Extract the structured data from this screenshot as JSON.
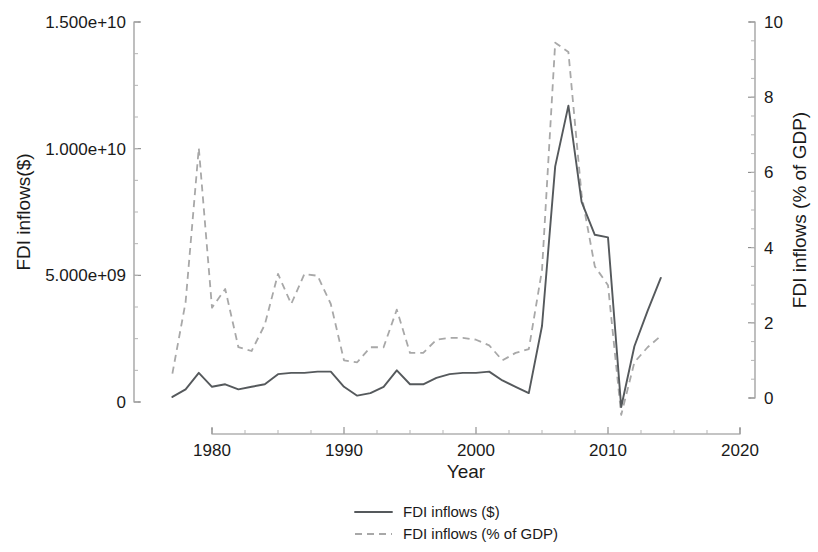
{
  "chart_data": {
    "type": "line",
    "title": "",
    "xlabel": "Year",
    "ylabel": "FDI inflows($)",
    "y2label": "FDI inflows (% of GDP)",
    "xlim": [
      1976,
      2020
    ],
    "xticks": [
      1980,
      1990,
      2000,
      2010,
      2020
    ],
    "xtick_labels": [
      "1980",
      "1990",
      "2000",
      "2010",
      "2020"
    ],
    "ylim": [
      -1000000000,
      15000000000
    ],
    "yticks": [
      0,
      5000000000,
      10000000000,
      15000000000
    ],
    "ytick_labels": [
      "0",
      "5.000e+09",
      "1.000e+10",
      "1.500e+10"
    ],
    "y2lim": [
      -0.7,
      10
    ],
    "y2ticks": [
      0,
      2,
      4,
      6,
      8,
      10
    ],
    "y2tick_labels": [
      "0",
      "2",
      "4",
      "6",
      "8",
      "10"
    ],
    "grid": false,
    "legend_position": "bottom",
    "x": [
      1977,
      1978,
      1979,
      1980,
      1981,
      1982,
      1983,
      1984,
      1985,
      1986,
      1987,
      1988,
      1989,
      1990,
      1991,
      1992,
      1993,
      1994,
      1995,
      1996,
      1997,
      1998,
      1999,
      2000,
      2001,
      2002,
      2003,
      2004,
      2005,
      2006,
      2007,
      2008,
      2009,
      2010,
      2011,
      2012,
      2013,
      2014
    ],
    "series": [
      {
        "name": "FDI inflows ($)",
        "axis": "left",
        "style": "solid",
        "color": "#55595c",
        "values": [
          200000000,
          500000000,
          1150000000,
          600000000,
          700000000,
          500000000,
          600000000,
          700000000,
          1100000000,
          1150000000,
          1150000000,
          1200000000,
          1200000000,
          600000000,
          250000000,
          350000000,
          600000000,
          1250000000,
          700000000,
          700000000,
          950000000,
          1100000000,
          1150000000,
          1150000000,
          1200000000,
          850000000,
          600000000,
          350000000,
          3000000000,
          9300000000,
          11700000000,
          7900000000,
          6600000000,
          6500000000,
          -200000000,
          2200000000,
          3600000000,
          4900000000
        ]
      },
      {
        "name": "FDI inflows (% of GDP)",
        "axis": "right",
        "style": "dashed",
        "color": "#a8a8a8",
        "values": [
          0.65,
          2.55,
          6.65,
          2.4,
          2.9,
          1.35,
          1.25,
          1.95,
          3.3,
          2.5,
          3.3,
          3.25,
          2.5,
          1.0,
          0.95,
          1.35,
          1.35,
          2.35,
          1.2,
          1.2,
          1.55,
          1.6,
          1.6,
          1.55,
          1.4,
          1.0,
          1.2,
          1.3,
          3.4,
          9.45,
          9.2,
          5.4,
          3.5,
          3.0,
          -0.45,
          0.95,
          1.35,
          1.65
        ]
      }
    ],
    "legend": [
      {
        "label": "FDI inflows ($)",
        "style": "solid",
        "color": "#55595c"
      },
      {
        "label": "FDI inflows (% of GDP)",
        "style": "dashed",
        "color": "#a8a8a8"
      }
    ]
  }
}
